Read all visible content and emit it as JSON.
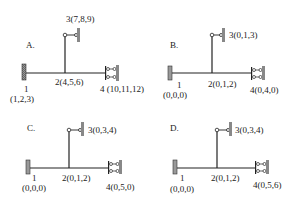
{
  "panels": [
    {
      "id": "A",
      "label": "A.",
      "node1": {
        "num": "1",
        "dof": "(1,2,3)"
      },
      "node2": "2(4,5,6)",
      "node3": "3(7,8,9)",
      "node4": "4 (10,11,12)"
    },
    {
      "id": "B",
      "label": "B.",
      "node1": {
        "num": "1",
        "dof": "(0,0,0)"
      },
      "node2": "2(0,1,2)",
      "node3": "3(0,1,3)",
      "node4": "4(0,4,0)"
    },
    {
      "id": "C",
      "label": "C.",
      "node1": {
        "num": "1",
        "dof": "(0,0,0)"
      },
      "node2": "2(0,1,2)",
      "node3": "3(0,3,4)",
      "node4": "4(0,5,0)"
    },
    {
      "id": "D",
      "label": "D.",
      "node1": {
        "num": "1",
        "dof": "(0,0,0)"
      },
      "node2": "2(0,1,2)",
      "node3": "3(0,3,4)",
      "node4": "4(0,5,6)"
    }
  ]
}
